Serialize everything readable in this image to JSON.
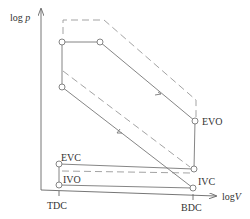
{
  "diagram": {
    "type": "p-V indicator diagram (log-log)",
    "axes": {
      "y_label_prefix": "log ",
      "y_label_var": "p",
      "x_label_prefix": "log",
      "x_label_var": "V"
    },
    "ticks": {
      "tdc": "TDC",
      "bdc": "BDC"
    },
    "points": {
      "evo": "EVO",
      "evc": "EVC",
      "ivo": "IVO",
      "ivc": "IVC"
    },
    "colors": {
      "line": "#777777",
      "dashed": "#999999",
      "text": "#333333"
    }
  }
}
